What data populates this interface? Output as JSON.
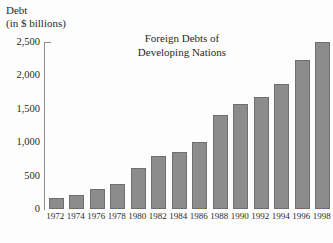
{
  "axis_caption": {
    "line1": "Debt",
    "line2": "(in $ billions)"
  },
  "title": {
    "line1": "Foreign Debts of",
    "line2": "Developing Nations"
  },
  "colors": {
    "bar_fill": "#8c8c8c",
    "bar_stroke": "#6f6f6f",
    "axis": "#8d8d8d",
    "text": "#2a2a2a",
    "background": "#fdfdfd"
  },
  "chart_data": {
    "type": "bar",
    "title": "Foreign Debts of Developing Nations",
    "xlabel": "",
    "ylabel": "Debt (in $ billions)",
    "ylim": [
      0,
      2500
    ],
    "yticks": [
      0,
      500,
      1000,
      1500,
      2000,
      2500
    ],
    "ytick_labels": [
      "0",
      "500",
      "1,000",
      "1,500",
      "2,000",
      "2,500"
    ],
    "grid": false,
    "legend": "none",
    "categories": [
      "1972",
      "1974",
      "1976",
      "1978",
      "1980",
      "1982",
      "1984",
      "1986",
      "1988",
      "1990",
      "1992",
      "1994",
      "1996",
      "1998"
    ],
    "values": [
      160,
      205,
      300,
      380,
      610,
      790,
      850,
      1010,
      1410,
      1570,
      1670,
      1870,
      2230,
      2500
    ]
  }
}
